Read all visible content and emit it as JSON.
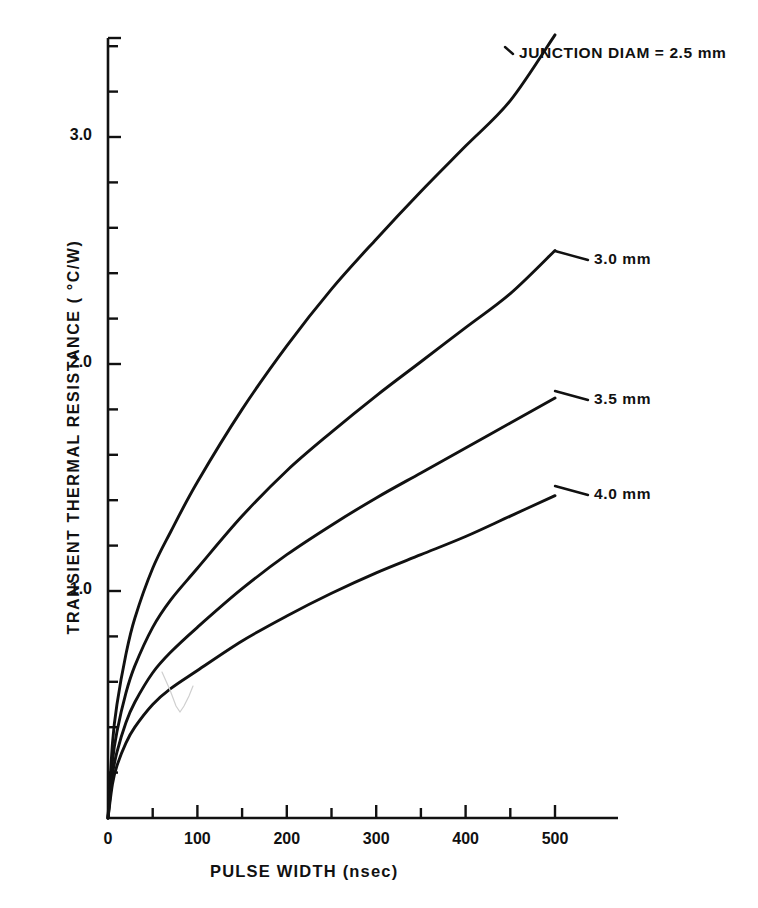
{
  "chart_data": {
    "type": "line",
    "title": "",
    "xlabel": "PULSE WIDTH (nsec)",
    "ylabel": "TRANSIENT THERMAL RESISTANCE ( °C/W)",
    "xlim": [
      0,
      550
    ],
    "ylim": [
      0,
      3.5
    ],
    "grid": false,
    "legend_position": "inline-annotations",
    "x_major_ticks": [
      0,
      100,
      200,
      300,
      400,
      500
    ],
    "x_major_tick_labels": [
      "0",
      "100",
      "200",
      "300",
      "400",
      "500"
    ],
    "x_minor_ticks": [
      50,
      150,
      250,
      350,
      450
    ],
    "y_major_ticks": [
      1.0,
      2.0,
      3.0
    ],
    "y_major_tick_labels": [
      "1.0",
      "2.0",
      "3.0"
    ],
    "y_minor_ticks": [
      0.2,
      0.4,
      0.6,
      0.8,
      1.2,
      1.4,
      1.6,
      1.8,
      2.2,
      2.4,
      2.6,
      2.8,
      3.2,
      3.4
    ],
    "x": [
      0,
      5,
      10,
      20,
      30,
      50,
      70,
      100,
      150,
      200,
      250,
      300,
      350,
      400,
      450,
      500
    ],
    "series": [
      {
        "name": "JUNCTION DIAM = 2.5 mm",
        "label": "JUNCTION DIAM = 2.5 mm",
        "values": [
          0,
          0.33,
          0.5,
          0.72,
          0.88,
          1.1,
          1.26,
          1.48,
          1.8,
          2.08,
          2.33,
          2.55,
          2.76,
          2.96,
          3.16,
          3.45
        ],
        "label_x": 519,
        "label_y": 46,
        "leader_from_x": 505,
        "leader_from_y": 47
      },
      {
        "name": "3.0 mm",
        "label": "3.0 mm",
        "values": [
          0,
          0.25,
          0.38,
          0.55,
          0.67,
          0.84,
          0.96,
          1.1,
          1.33,
          1.53,
          1.7,
          1.86,
          2.01,
          2.16,
          2.31,
          2.5
        ],
        "label_x": 594,
        "label_y": 252,
        "leader_from_x": 555,
        "leader_from_y": 251
      },
      {
        "name": "3.5 mm",
        "label": "3.5 mm",
        "values": [
          0,
          0.19,
          0.29,
          0.42,
          0.51,
          0.64,
          0.73,
          0.84,
          1.01,
          1.16,
          1.29,
          1.41,
          1.52,
          1.63,
          1.74,
          1.85
        ],
        "label_x": 594,
        "label_y": 392,
        "leader_from_x": 555,
        "leader_from_y": 391
      },
      {
        "name": "4.0 mm",
        "label": "4.0 mm",
        "values": [
          0,
          0.15,
          0.23,
          0.33,
          0.4,
          0.5,
          0.57,
          0.65,
          0.78,
          0.89,
          0.99,
          1.08,
          1.16,
          1.24,
          1.33,
          1.42
        ],
        "label_x": 594,
        "label_y": 487,
        "leader_from_x": 555,
        "leader_from_y": 486
      }
    ],
    "colors": {
      "line": "#111111",
      "axis": "#111111",
      "background": "#ffffff"
    }
  }
}
